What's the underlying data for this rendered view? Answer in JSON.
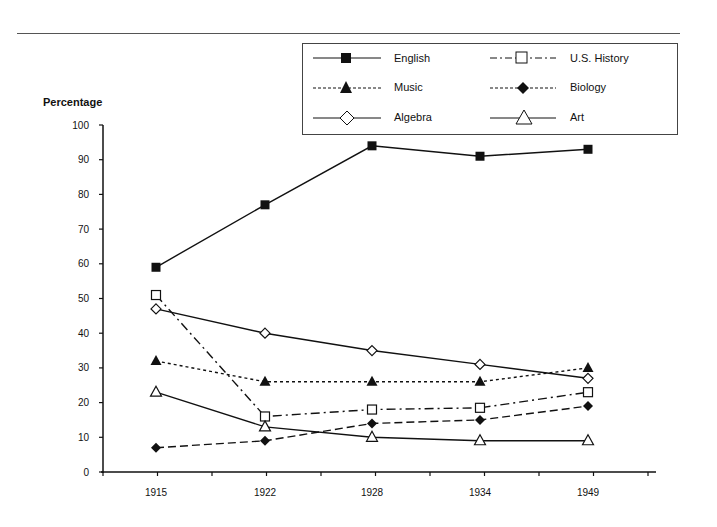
{
  "chart_data": {
    "type": "line",
    "title": "",
    "xlabel": "",
    "ylabel": "Percentage",
    "ylim": [
      0,
      100
    ],
    "yticks": [
      0,
      10,
      20,
      30,
      40,
      50,
      60,
      70,
      80,
      90,
      100
    ],
    "categories": [
      "1915",
      "1922",
      "1928",
      "1934",
      "1949"
    ],
    "grid": false,
    "legend_position": "top-right",
    "series": [
      {
        "name": "English",
        "marker": "filled-square",
        "line": "solid",
        "values": [
          59,
          77,
          94,
          91,
          93
        ]
      },
      {
        "name": "U.S. History",
        "marker": "open-square",
        "line": "dash-dot",
        "values": [
          51,
          16,
          18,
          18.5,
          23
        ]
      },
      {
        "name": "Music",
        "marker": "filled-triangle",
        "line": "dotted",
        "values": [
          32,
          26,
          26,
          26,
          30
        ]
      },
      {
        "name": "Biology",
        "marker": "filled-diamond",
        "line": "dashed",
        "values": [
          7,
          9,
          14,
          15,
          19
        ]
      },
      {
        "name": "Algebra",
        "marker": "open-diamond",
        "line": "solid",
        "values": [
          47,
          40,
          35,
          31,
          27
        ]
      },
      {
        "name": "Art",
        "marker": "open-triangle",
        "line": "solid",
        "values": [
          23,
          13,
          10,
          9,
          9
        ]
      }
    ]
  },
  "legend": {
    "items": [
      {
        "label": "English"
      },
      {
        "label": "U.S. History"
      },
      {
        "label": "Music"
      },
      {
        "label": "Biology"
      },
      {
        "label": "Algebra"
      },
      {
        "label": "Art"
      }
    ]
  },
  "axis": {
    "y_title": "Percentage"
  }
}
